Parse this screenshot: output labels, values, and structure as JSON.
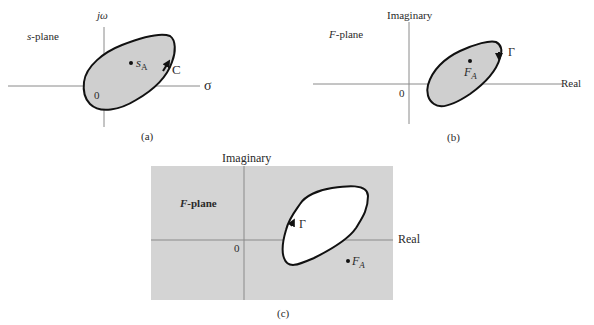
{
  "colors": {
    "region_fill": "#cfcfcf",
    "panel_bg": "#d4d4d4",
    "axis": "#8a8a8a",
    "contour": "#111111",
    "text": "#2a2a2a"
  },
  "panel_a": {
    "plane_label": "s-plane",
    "plane_var": "s",
    "plane_suffix": "-plane",
    "y_axis_label": "jω",
    "x_axis_label": "σ",
    "origin_label": "0",
    "point_label": "s",
    "point_sub": "A",
    "contour_label": "C",
    "caption": "(a)"
  },
  "panel_b": {
    "plane_label": "F-plane",
    "plane_var": "F",
    "plane_suffix": "-plane",
    "y_axis_label": "Imaginary",
    "x_axis_label": "Real",
    "origin_label": "0",
    "point_label": "F",
    "point_sub": "A",
    "contour_label": "Γ",
    "caption": "(b)"
  },
  "panel_c": {
    "plane_label": "F-plane",
    "plane_var": "F",
    "plane_suffix": "-plane",
    "y_axis_label": "Imaginary",
    "x_axis_label": "Real",
    "origin_label": "0",
    "point_label": "F",
    "point_sub": "A",
    "contour_label": "Γ",
    "caption": "(c)"
  }
}
